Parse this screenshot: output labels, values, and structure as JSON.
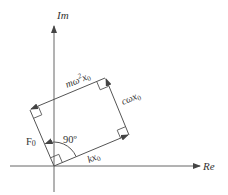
{
  "diagram": {
    "title": "",
    "type": "phasor-diagram",
    "colors": {
      "stroke": "#555555",
      "text": "#333333",
      "background": "#ffffff"
    },
    "axes": {
      "imaginary": {
        "label": "Im"
      },
      "real": {
        "label": "Re"
      }
    },
    "vectors": {
      "spring": {
        "label_main": "kx",
        "label_sub": "0"
      },
      "damping": {
        "label_main": "cωx",
        "label_sub": "0"
      },
      "inertia": {
        "label_main": "mω",
        "label_sup": "2",
        "label_x": "x",
        "label_sub": "0"
      },
      "force": {
        "label_main": "F",
        "label_sub": "0"
      }
    },
    "angle": {
      "label": "90º"
    }
  }
}
